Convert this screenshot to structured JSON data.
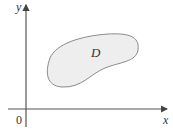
{
  "diagram": {
    "axes": {
      "x_label": "x",
      "y_label": "y",
      "origin_label": "0"
    },
    "region": {
      "label": "D",
      "fill": "#eeeeee",
      "stroke": "#8a8a8a"
    },
    "axis_color": "#555555"
  }
}
